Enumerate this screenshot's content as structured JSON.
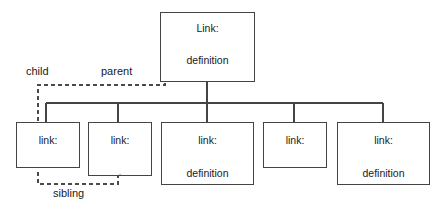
{
  "diagram": {
    "type": "tree",
    "colors": {
      "background": "#ffffff",
      "stroke": "#444444",
      "dashed_stroke": "#4a4a4a",
      "text": "#1a1a1a"
    },
    "nodes": [
      {
        "id": "root",
        "title": "Link:",
        "definition": "definition",
        "level": "root"
      },
      {
        "id": "child-1",
        "title": "link:",
        "definition": "",
        "level": "child"
      },
      {
        "id": "child-2",
        "title": "link:",
        "definition": "",
        "tick": ".",
        "level": "child"
      },
      {
        "id": "child-3",
        "title": "link:",
        "definition": "definition",
        "level": "child"
      },
      {
        "id": "child-4",
        "title": "link:",
        "definition": "",
        "level": "child"
      },
      {
        "id": "child-5",
        "title": "link:",
        "definition": "definition",
        "level": "child"
      }
    ],
    "relationship_labels": {
      "child": "child",
      "parent": "parent",
      "sibling": "sibling"
    }
  }
}
